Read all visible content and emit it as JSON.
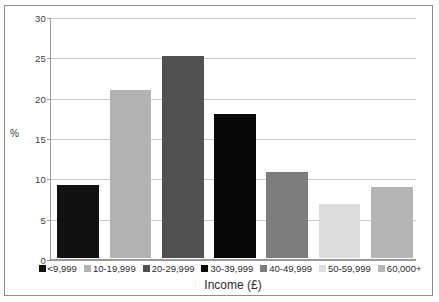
{
  "chart_data": {
    "type": "bar",
    "title": "",
    "xlabel": "Income (£)",
    "ylabel": "%",
    "categories": [
      "<9,999",
      "10-19,999",
      "20-29,999",
      "30-39,999",
      "40-49,999",
      "50-59,999",
      "60,000+"
    ],
    "values": [
      9.0,
      20.8,
      25.0,
      17.8,
      10.7,
      6.7,
      8.8
    ],
    "colors": [
      "#111111",
      "#b2b2b2",
      "#505050",
      "#080808",
      "#7d7d7d",
      "#dcdcdc",
      "#b5b5b5"
    ],
    "ylim": [
      0,
      30
    ],
    "yticks": [
      0,
      5,
      10,
      15,
      20,
      25,
      30
    ],
    "ytick_labels": [
      "0",
      "5",
      "10",
      "15",
      "20",
      "25",
      "30"
    ],
    "grid": true,
    "legend_position": "bottom",
    "legend_entries": [
      {
        "label": "<9,999",
        "color": "#111111"
      },
      {
        "label": "10-19,999",
        "color": "#b2b2b2"
      },
      {
        "label": "20-29,999",
        "color": "#505050"
      },
      {
        "label": "30-39,999",
        "color": "#080808"
      },
      {
        "label": "40-49,999",
        "color": "#7d7d7d"
      },
      {
        "label": "50-59,999",
        "color": "#dcdcdc"
      },
      {
        "label": "60,000+",
        "color": "#b5b5b5"
      }
    ]
  }
}
